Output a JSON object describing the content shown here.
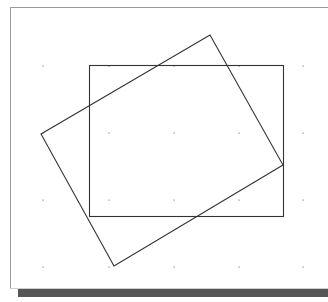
{
  "canvas": {
    "width": 328,
    "height": 302,
    "background": "#ffffff",
    "frame": {
      "x": 10,
      "y": 7,
      "width": 318,
      "height": 281,
      "border_color": "#9a9a9a"
    },
    "shadow": {
      "x": 18,
      "y": 289,
      "width": 310,
      "height": 8,
      "color": "#555555"
    }
  },
  "grid": {
    "dot_color": "#8a8a8a",
    "xs": [
      43,
      109,
      174,
      239,
      303
    ],
    "ys": [
      66,
      133,
      200,
      267
    ]
  },
  "shapes": [
    {
      "name": "axis-aligned-rectangle",
      "type": "rectangle",
      "x": 89,
      "y": 65,
      "width": 194,
      "height": 151,
      "stroke": "#333333"
    },
    {
      "name": "rotated-rectangle",
      "type": "polygon",
      "points": [
        [
          210,
          35
        ],
        [
          283,
          165
        ],
        [
          114,
          266
        ],
        [
          41,
          134
        ]
      ],
      "stroke": "#333333"
    }
  ]
}
